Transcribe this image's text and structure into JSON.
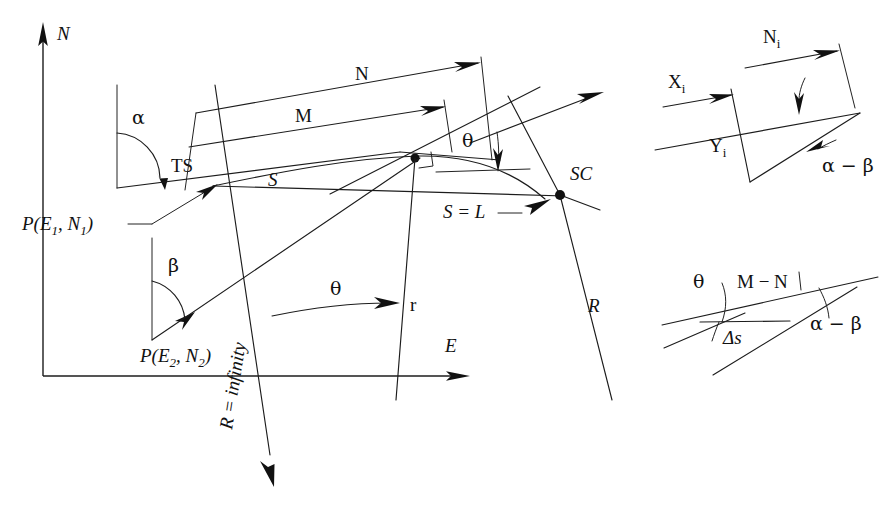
{
  "figure": {
    "background_color": "#ffffff",
    "ink_color": "#111111",
    "width": 896,
    "height": 522
  },
  "axes": {
    "north_label": "N",
    "east_label": "E"
  },
  "main": {
    "point_ts": "TS",
    "point_sc": "SC",
    "point_p1": "P(E",
    "point_p1_sub1": "1",
    "point_p1_mid": ", N",
    "point_p1_sub2": "1",
    "point_p1_end": ")",
    "point_p2": "P(E",
    "point_p2_sub1": "2",
    "point_p2_mid": ", N",
    "point_p2_sub2": "2",
    "point_p2_end": ")",
    "dim_n": "N",
    "dim_m": "M",
    "arc_s": "S",
    "arc_s_equals_l": "S = L",
    "angle_alpha": "α",
    "angle_beta": "β",
    "angle_theta_top": "θ",
    "angle_theta_bottom": "θ",
    "radius_r_small": "r",
    "radius_r_big": "R",
    "radius_infinity": "R = infinity"
  },
  "inset_top": {
    "label_ni": "N",
    "label_ni_sub": "i",
    "label_xi": "X",
    "label_xi_sub": "i",
    "label_yi": "Y",
    "label_yi_sub": "i",
    "label_alpha_minus_beta": "α − β"
  },
  "inset_bottom": {
    "label_theta": "θ",
    "label_m_minus_n": "M − N",
    "label_delta_s": "Δs",
    "label_alpha_minus_beta": "α − β"
  }
}
